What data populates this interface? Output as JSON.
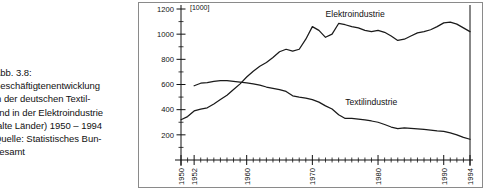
{
  "caption": {
    "lines": [
      "Abb. 3.8:",
      "Beschäftigtenentwicklung",
      "in der deutschen Textil-",
      "und in der Elektroindustrie",
      "(alte Länder) 1950 – 1994",
      "Quelle: Statistisches Bun-",
      "desamt"
    ]
  },
  "chart_data": {
    "type": "line",
    "title": "",
    "subtitle": "",
    "unit_label": "[1000]",
    "xlabel": "",
    "ylabel": "",
    "xlim": [
      1950,
      1994
    ],
    "ylim": [
      0,
      1200
    ],
    "grid": false,
    "legend": "inline-annotations",
    "y_ticks": [
      200,
      400,
      600,
      800,
      1000,
      1200
    ],
    "y_tick_labels": [
      "200",
      "400",
      "600",
      "800",
      "1000",
      "1200"
    ],
    "y_minor_step": 100,
    "x_ticks": [
      1950,
      1952,
      1960,
      1970,
      1980,
      1990,
      1994
    ],
    "x_tick_labels": [
      "1950",
      "1952",
      "1960",
      "1970",
      "1980",
      "1990",
      "1994"
    ],
    "x_minor_step": 1,
    "series": [
      {
        "name": "Elektroindustrie",
        "label_x": 1972,
        "label_y": 1140,
        "x": [
          1950,
          1951,
          1952,
          1953,
          1954,
          1955,
          1956,
          1957,
          1958,
          1959,
          1960,
          1961,
          1962,
          1963,
          1964,
          1965,
          1966,
          1967,
          1968,
          1969,
          1970,
          1971,
          1972,
          1973,
          1974,
          1975,
          1976,
          1977,
          1978,
          1979,
          1980,
          1981,
          1982,
          1983,
          1984,
          1985,
          1986,
          1987,
          1988,
          1989,
          1990,
          1991,
          1992,
          1993,
          1994
        ],
        "values": [
          320,
          345,
          390,
          405,
          415,
          445,
          480,
          515,
          560,
          605,
          660,
          705,
          745,
          775,
          815,
          860,
          880,
          865,
          880,
          960,
          1060,
          1030,
          975,
          1000,
          1085,
          1075,
          1060,
          1050,
          1030,
          1020,
          1030,
          1015,
          985,
          950,
          960,
          985,
          1010,
          1020,
          1035,
          1060,
          1090,
          1095,
          1080,
          1050,
          1020
        ]
      },
      {
        "name": "Textilindustrie",
        "label_x": 1975,
        "label_y": 440,
        "x": [
          1952,
          1953,
          1954,
          1955,
          1956,
          1957,
          1958,
          1959,
          1960,
          1961,
          1962,
          1963,
          1964,
          1965,
          1966,
          1967,
          1968,
          1969,
          1970,
          1971,
          1972,
          1973,
          1974,
          1975,
          1976,
          1977,
          1978,
          1979,
          1980,
          1981,
          1982,
          1983,
          1984,
          1985,
          1986,
          1987,
          1988,
          1989,
          1990,
          1991,
          1992,
          1993,
          1994
        ],
        "values": [
          590,
          610,
          615,
          625,
          630,
          630,
          625,
          618,
          612,
          605,
          595,
          580,
          570,
          560,
          545,
          510,
          500,
          492,
          480,
          460,
          430,
          405,
          360,
          330,
          330,
          325,
          318,
          310,
          300,
          282,
          262,
          250,
          255,
          252,
          248,
          243,
          238,
          232,
          228,
          215,
          200,
          180,
          165
        ]
      }
    ]
  }
}
